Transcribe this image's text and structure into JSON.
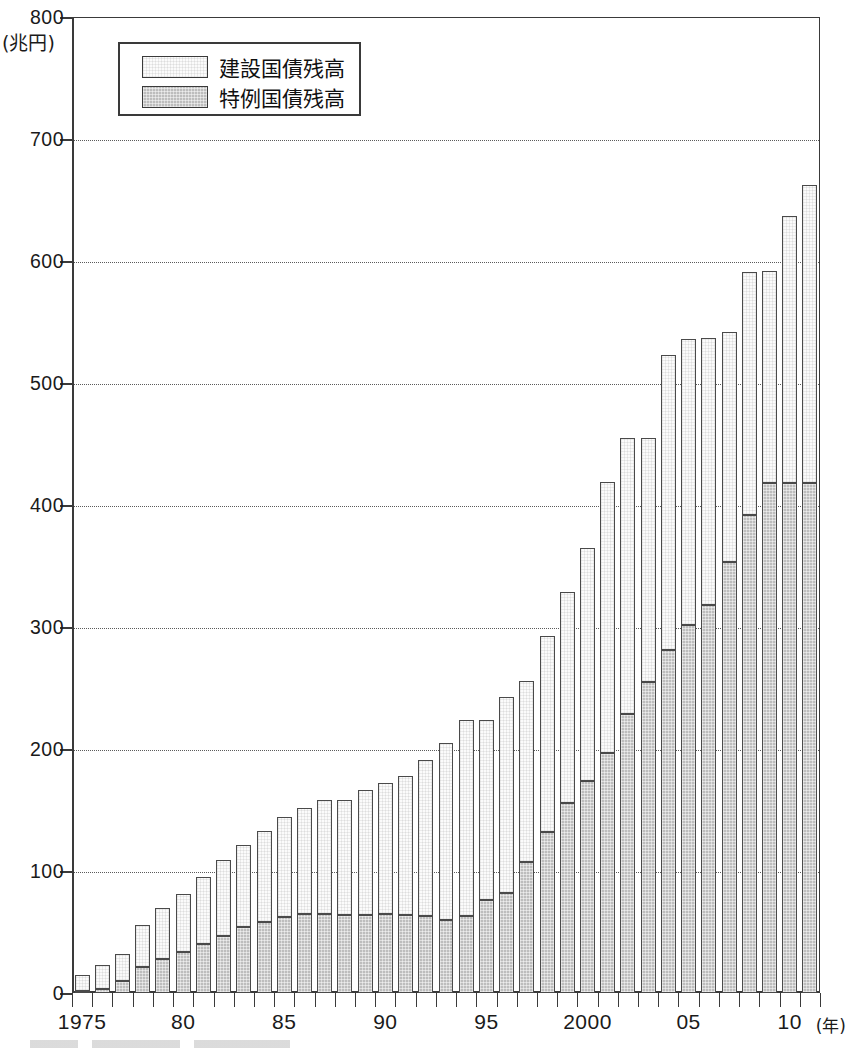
{
  "chart_data": {
    "type": "bar",
    "stacked": true,
    "title": "",
    "subtitle": "",
    "xlabel": "(年)",
    "ylabel": "(兆円)",
    "ylim": [
      0,
      800
    ],
    "ytick_step": 100,
    "ytick_labels": [
      "0",
      "100",
      "200",
      "300",
      "400",
      "500",
      "600",
      "700",
      "800"
    ],
    "ytick_values": [
      0,
      100,
      200,
      300,
      400,
      500,
      600,
      700,
      800
    ],
    "grid": "horizontal-dotted",
    "legend_position": "top-left-inside",
    "x": [
      1975,
      1976,
      1977,
      1978,
      1979,
      1980,
      1981,
      1982,
      1983,
      1984,
      1985,
      1986,
      1987,
      1988,
      1989,
      1990,
      1991,
      1992,
      1993,
      1994,
      1995,
      1996,
      1997,
      1998,
      1999,
      2000,
      2001,
      2002,
      2003,
      2004,
      2005,
      2006,
      2007,
      2008,
      2009,
      2010,
      2011
    ],
    "xtick_labels": [
      "1975",
      "80",
      "85",
      "90",
      "95",
      "2000",
      "05",
      "10"
    ],
    "xtick_years": [
      1975,
      1980,
      1985,
      1990,
      1995,
      2000,
      2005,
      2010
    ],
    "series": [
      {
        "name": "特例国債残高",
        "key": "special",
        "color": "#bdbdbd",
        "values": [
          2,
          3,
          10,
          21,
          28,
          34,
          40,
          47,
          54,
          58,
          62,
          65,
          65,
          64,
          64,
          65,
          64,
          63,
          60,
          63,
          76,
          82,
          107,
          132,
          156,
          174,
          197,
          229,
          255,
          281,
          302,
          318,
          353,
          392,
          418,
          418,
          418
        ]
      },
      {
        "name": "建設国債残高",
        "key": "construction",
        "color": "#fbfbfb",
        "values": [
          13,
          20,
          22,
          35,
          42,
          47,
          55,
          62,
          67,
          75,
          82,
          87,
          93,
          94,
          102,
          107,
          114,
          128,
          145,
          161,
          148,
          161,
          149,
          161,
          173,
          191,
          222,
          226,
          200,
          242,
          234,
          219,
          189,
          199,
          174,
          219,
          244
        ]
      }
    ],
    "totals": [
      15,
      23,
      32,
      56,
      70,
      81,
      95,
      109,
      121,
      133,
      144,
      152,
      158,
      158,
      166,
      172,
      178,
      191,
      205,
      224,
      224,
      243,
      256,
      293,
      329,
      365,
      419,
      455,
      455,
      523,
      536,
      537,
      542,
      591,
      592,
      637,
      662
    ],
    "legend": [
      {
        "label": "建設国債残高",
        "key": "construction"
      },
      {
        "label": "特例国債残高",
        "key": "special"
      }
    ]
  },
  "colors": {
    "axis": "#3a3a3a",
    "grid": "#5b5b5b",
    "bar_border": "#4a4a4a",
    "construction_fill": "#fbfbfb",
    "special_fill": "#bdbdbd",
    "text": "#1a1a1a",
    "background": "#ffffff"
  }
}
